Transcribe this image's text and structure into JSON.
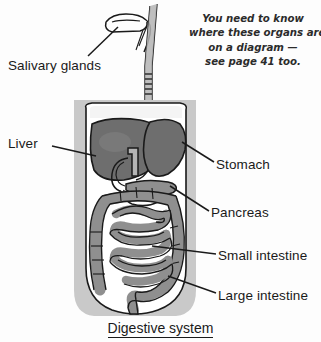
{
  "figure": {
    "caption": "Digestive system",
    "title_alt": "Digestive system diagram",
    "background_color": "#fdfdfd",
    "body_panel_color": "#c9c9c9",
    "body_outline_color": "#ffffff",
    "organ_dark_color": "#6e6e6e",
    "organ_mid_color": "#8f8f8f",
    "organ_light_color": "#b4b4b4",
    "outline_color": "#1a1a1a",
    "leader_line_color": "#1a1a1a"
  },
  "labels": [
    {
      "id": "salivary-glands",
      "text": "Salivary glands"
    },
    {
      "id": "liver",
      "text": "Liver"
    },
    {
      "id": "stomach",
      "text": "Stomach"
    },
    {
      "id": "pancreas",
      "text": "Pancreas"
    },
    {
      "id": "small-intestine",
      "text": "Small intestine"
    },
    {
      "id": "large-intestine",
      "text": "Large intestine"
    }
  ],
  "note": {
    "line1": "You need to know",
    "line2": "where these organs are",
    "line3": "on a diagram —",
    "line4": "see page 41 too."
  }
}
